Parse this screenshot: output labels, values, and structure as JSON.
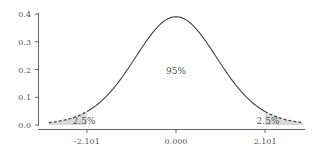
{
  "chart_data": {
    "type": "area",
    "title": "",
    "xlabel": "",
    "ylabel": "",
    "distribution": "t-distribution probability density",
    "xlim": [
      -3.0,
      3.0
    ],
    "ylim": [
      0.0,
      0.4
    ],
    "grid": false,
    "legend": null,
    "y_ticks": [
      {
        "value": 0.0,
        "label": "0.0"
      },
      {
        "value": 0.1,
        "label": "0.1"
      },
      {
        "value": 0.2,
        "label": "0.2"
      },
      {
        "value": 0.3,
        "label": "0.3"
      },
      {
        "value": 0.4,
        "label": "0.4"
      }
    ],
    "x_ticks": [
      {
        "value": -2.101,
        "label": "-2.101"
      },
      {
        "value": 0.0,
        "label": "0.000"
      },
      {
        "value": 2.101,
        "label": "2.101"
      }
    ],
    "critical_values": [
      -2.101,
      2.101
    ],
    "peak": {
      "x": 0.0,
      "y": 0.39
    },
    "regions": [
      {
        "name": "left-tail",
        "range": [
          -3.0,
          -2.101
        ],
        "label": "2.5%",
        "style": "dashed-shaded"
      },
      {
        "name": "center",
        "range": [
          -2.101,
          2.101
        ],
        "label": "95%",
        "style": "solid"
      },
      {
        "name": "right-tail",
        "range": [
          2.101,
          3.0
        ],
        "label": "2.5%",
        "style": "dashed-shaded"
      }
    ],
    "colors": {
      "curve": "#444444",
      "tail_fill": "#d9d9d9",
      "axis": "#555555",
      "text": "#555555"
    }
  }
}
